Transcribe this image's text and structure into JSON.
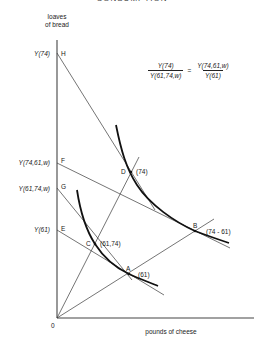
{
  "header": {
    "title": "CONSUMPTION"
  },
  "axes": {
    "y_title_line1": "loaves",
    "y_title_line2": "of bread",
    "x_title": "pounds of cheese",
    "origin_label": "0"
  },
  "y_axis_labels": {
    "H": {
      "value": "Y(74)",
      "point": "H"
    },
    "F": {
      "value": "Y(74,61,w)",
      "point": "F"
    },
    "G": {
      "value": "Y(61,74,w)",
      "point": "G"
    },
    "E": {
      "value": "Y(61)",
      "point": "E"
    }
  },
  "points": {
    "D": {
      "name": "D",
      "tag": "(74)"
    },
    "B": {
      "name": "B",
      "tag": "(74 - 61)"
    },
    "C": {
      "name": "C",
      "tag": "(61,74)"
    },
    "A": {
      "name": "A",
      "tag": "(61)"
    }
  },
  "equation": {
    "lhs_num": "Y(74)",
    "lhs_den": "Y(61,74,w)",
    "equals": "=",
    "rhs_num": "Y(74,61,w)",
    "rhs_den": "Y(61)"
  },
  "colors": {
    "line": "#3a3a3a",
    "curve": "#111111",
    "axis": "#444444"
  }
}
